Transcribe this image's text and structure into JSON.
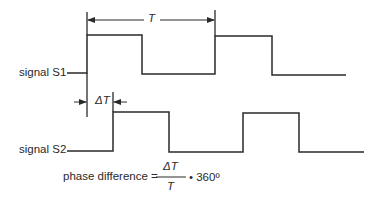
{
  "diagram": {
    "type": "timing-diagram",
    "signals": [
      {
        "name": "signal S1",
        "edges_x": [
          87,
          142,
          215,
          272
        ],
        "high_y": 35,
        "low_y": 74,
        "start_x": 67,
        "end_x": 346
      },
      {
        "name": "signal S2",
        "edges_x": [
          113,
          169,
          243,
          299
        ],
        "high_y": 112,
        "low_y": 152,
        "start_x": 67,
        "end_x": 364
      }
    ],
    "period_label": "T",
    "delay_label": "ΔT",
    "formula": {
      "prefix": "phase difference =",
      "numerator": "ΔT",
      "denominator": "T",
      "multiplier": "• 360º"
    },
    "colors": {
      "line": "#2a2a2a",
      "background": "#ffffff"
    }
  }
}
